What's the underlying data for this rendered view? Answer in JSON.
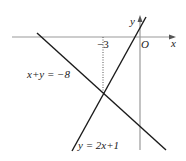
{
  "diagram": {
    "type": "coordinate-plane-linear-system",
    "axes": {
      "x_label": "x",
      "y_label": "y",
      "origin_label": "O",
      "x_axis_y": 37,
      "y_axis_x": 140
    },
    "tick_labels": {
      "neg3": "−3"
    },
    "lines": [
      {
        "id": "line1",
        "equation": "x+y = −8",
        "label": "x+y = −8",
        "x1": 37,
        "y1": 33,
        "x2": 166,
        "y2": 150
      },
      {
        "id": "line2",
        "equation": "y = 2x+1",
        "label": "y = 2x+1",
        "x1": 72,
        "y1": 151,
        "x2": 146,
        "y2": 17
      }
    ],
    "intersection": {
      "x": -3,
      "y": -5,
      "px": 103,
      "py": 93
    },
    "colors": {
      "axis": "#9a9a9a",
      "line": "#1a1a1a",
      "text": "#222222"
    }
  }
}
